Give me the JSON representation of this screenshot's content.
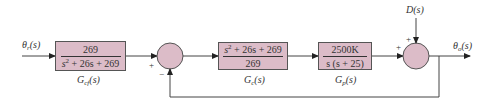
{
  "diagram": {
    "type": "feedback-control-block-diagram",
    "colors": {
      "block_fill": "#dcbcc8",
      "line": "#333333"
    },
    "input": {
      "label": "θr(s)",
      "symbol": "θ",
      "sub": "r",
      "arg": "(s)"
    },
    "output": {
      "label": "θo(s)",
      "symbol": "θ",
      "sub": "o",
      "arg": "(s)"
    },
    "disturbance": {
      "label": "D(s)"
    },
    "blocks": [
      {
        "id": "Gcf",
        "name": "G",
        "sub": "cf",
        "arg": "(s)",
        "numerator": "269",
        "denominator_pre": "s",
        "denominator_sup": "2",
        "denominator_post": " + 26s + 269"
      },
      {
        "id": "Gc",
        "name": "G",
        "sub": "c",
        "arg": "(s)",
        "numerator_pre": "s",
        "numerator_sup": "2",
        "numerator_post": " + 26s + 269",
        "denominator": "269"
      },
      {
        "id": "Gp",
        "name": "G",
        "sub": "p",
        "arg": "(s)",
        "numerator": "2500K",
        "denominator": "s (s + 25)"
      }
    ],
    "summing_junctions": [
      {
        "id": "sum1",
        "signs": {
          "left": "+",
          "bottom": "−"
        }
      },
      {
        "id": "sum2",
        "signs": {
          "left": "+",
          "top": "+"
        }
      }
    ]
  }
}
